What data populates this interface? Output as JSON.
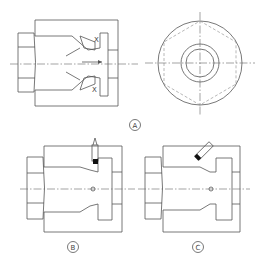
{
  "figure": {
    "views": [
      {
        "id": "A",
        "label": "A",
        "description": "Section view of fitting with X-marked cone seats, plus end view"
      },
      {
        "id": "B",
        "label": "B",
        "description": "Section view with vertical tool/probe insertion"
      },
      {
        "id": "C",
        "label": "C",
        "description": "Section view with angled tool/probe insertion"
      }
    ],
    "annotations": {
      "x_top": "X",
      "x_bottom": "X"
    },
    "colors": {
      "line": "#555555",
      "fill_marker": "#111111",
      "background": "#ffffff"
    }
  }
}
